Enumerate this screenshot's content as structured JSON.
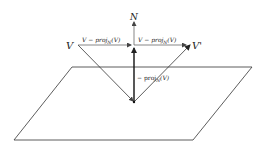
{
  "diagram": {
    "labels": {
      "normal": "N",
      "incident": "V",
      "reflected": "V'",
      "left_horizontal": "V − proj_N(V)",
      "right_horizontal": "V − proj_N(V)",
      "vertical": "− proj_N(V)"
    },
    "label_parts": {
      "left_horizontal": {
        "pre": "V − proj",
        "sub": "N",
        "post": "(V)"
      },
      "right_horizontal": {
        "pre": "V − proj",
        "sub": "N",
        "post": "(V)"
      },
      "vertical": {
        "pre": "− proj",
        "sub": "N",
        "post": "(V)"
      }
    },
    "colors": {
      "stroke": "#222222",
      "text": "#222222",
      "background": "#ffffff"
    }
  }
}
